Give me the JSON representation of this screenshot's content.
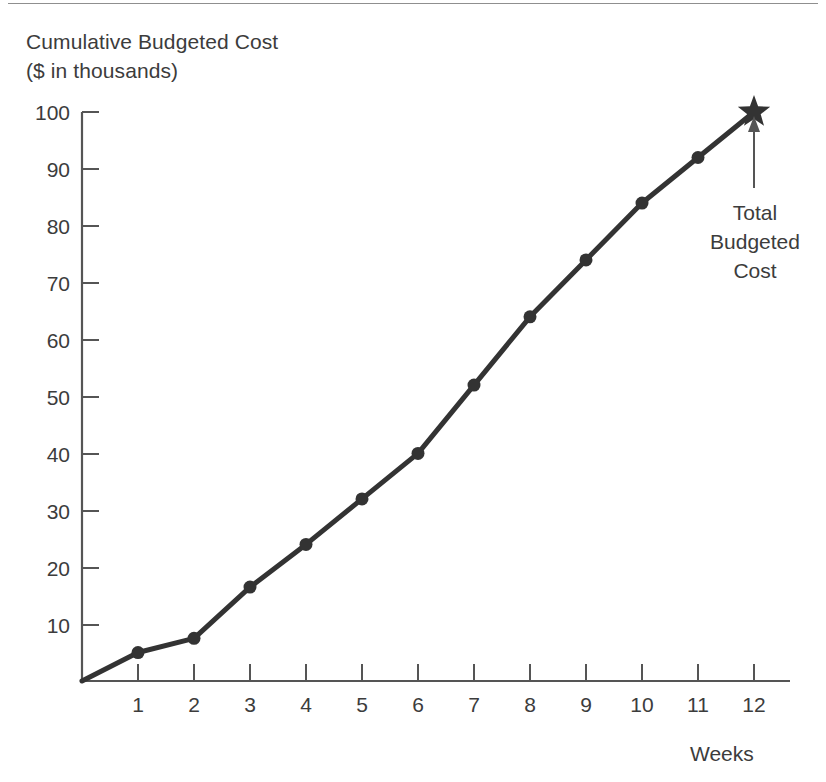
{
  "figure": {
    "title_line1": "Cumulative Budgeted Cost",
    "title_line2": "($ in thousands)",
    "title": "Cumulative Budgeted Cost\n($ in thousands)",
    "x_axis_label": "Weeks",
    "annotation": "Total\nBudgeted\nCost",
    "annotation_line1": "Total",
    "annotation_line2": "Budgeted",
    "annotation_line3": "Cost",
    "line_color": "#333333",
    "text_color": "#3c3c3c",
    "axis_color": "#555555",
    "background": "#ffffff"
  },
  "chart_data": {
    "type": "line",
    "title": "Cumulative Budgeted Cost ($ in thousands)",
    "xlabel": "Weeks",
    "ylabel": "Cumulative Budgeted Cost ($ in thousands)",
    "xlim": [
      0,
      12.6
    ],
    "ylim": [
      0,
      103
    ],
    "grid": false,
    "legend": null,
    "x_tick_labels": [
      "1",
      "2",
      "3",
      "4",
      "5",
      "6",
      "7",
      "8",
      "9",
      "10",
      "11",
      "12"
    ],
    "y_tick_labels": [
      "10",
      "20",
      "30",
      "40",
      "50",
      "60",
      "70",
      "80",
      "90",
      "100"
    ],
    "x_ticks": [
      1,
      2,
      3,
      4,
      5,
      6,
      7,
      8,
      9,
      10,
      11,
      12
    ],
    "y_ticks": [
      10,
      20,
      30,
      40,
      50,
      60,
      70,
      80,
      90,
      100
    ],
    "x": [
      0,
      1,
      2,
      3,
      4,
      5,
      6,
      7,
      8,
      9,
      10,
      11,
      12
    ],
    "values": [
      0,
      5,
      7.5,
      16.5,
      24,
      32,
      40,
      52,
      64,
      74,
      84,
      92,
      100
    ],
    "markers": [
      {
        "x": 1,
        "y": 5
      },
      {
        "x": 2,
        "y": 7.5
      },
      {
        "x": 3,
        "y": 16.5
      },
      {
        "x": 4,
        "y": 24
      },
      {
        "x": 5,
        "y": 32
      },
      {
        "x": 6,
        "y": 40
      },
      {
        "x": 7,
        "y": 52
      },
      {
        "x": 8,
        "y": 64
      },
      {
        "x": 9,
        "y": 74
      },
      {
        "x": 10,
        "y": 84
      },
      {
        "x": 11,
        "y": 92
      }
    ],
    "star_marker": {
      "x": 12,
      "y": 100,
      "label": "Total Budgeted Cost"
    },
    "annotations": [
      {
        "text": "Total Budgeted Cost",
        "points_to_x": 12,
        "points_to_y": 100,
        "arrow": "up"
      }
    ]
  }
}
